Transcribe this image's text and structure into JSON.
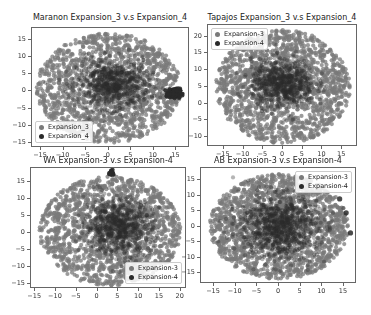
{
  "colors": {
    "expansion3": "#7a7a7a",
    "expansion4": "#2a2a2a",
    "axes_border": "#666666"
  },
  "chart_data": [
    {
      "type": "scatter",
      "title": "Maranon Expansion_3 v.s Expansion_4",
      "xlabel": "",
      "ylabel": "",
      "xticks": [
        -15,
        -10,
        -5,
        0,
        5,
        10,
        15
      ],
      "yticks": [
        -15,
        -10,
        -5,
        0,
        5,
        10,
        15
      ],
      "xlim": [
        -17,
        18
      ],
      "ylim": [
        -16.5,
        18.5
      ],
      "legend": {
        "position": "lower left",
        "entries": [
          "Expansion_3",
          "Expansion_4"
        ]
      },
      "series": [
        {
          "name": "Expansion_3",
          "distribution": "broad disk",
          "center": [
            0,
            1
          ],
          "radius": [
            16,
            16
          ],
          "count": 1400
        },
        {
          "name": "Expansion_4",
          "distribution": "dense core + tight cluster",
          "center": [
            1,
            2
          ],
          "radius": [
            8,
            7
          ],
          "count": 700,
          "extra_cluster": {
            "center": [
              14.5,
              -0.5
            ],
            "radius": [
              1.3,
              1.3
            ],
            "count": 160
          }
        }
      ]
    },
    {
      "type": "scatter",
      "title": "Tapajos Expansion_3 v.s Expansion_4",
      "xlabel": "",
      "ylabel": "",
      "xticks": [
        -15,
        -10,
        -5,
        0,
        5,
        10,
        15
      ],
      "yticks": [
        -10,
        -5,
        0,
        5,
        10,
        15,
        20
      ],
      "xlim": [
        -19,
        19
      ],
      "ylim": [
        -13,
        23.5
      ],
      "legend": {
        "position": "upper left",
        "entries": [
          "Expansion-3",
          "Expansion-4"
        ]
      },
      "series": [
        {
          "name": "Expansion-3",
          "distribution": "broad disk",
          "center": [
            0,
            5
          ],
          "radius": [
            17,
            17
          ],
          "count": 1500
        },
        {
          "name": "Expansion-4",
          "distribution": "dense core",
          "center": [
            0,
            6
          ],
          "radius": [
            8,
            7
          ],
          "count": 700
        }
      ]
    },
    {
      "type": "scatter",
      "title": "WA Expansion-3 v.s Expansion-4",
      "xlabel": "",
      "ylabel": "",
      "xticks": [
        -15,
        -10,
        -5,
        0,
        5,
        10,
        15,
        20
      ],
      "yticks": [
        -15,
        -10,
        -5,
        0,
        5,
        10,
        15
      ],
      "xlim": [
        -16,
        21.5
      ],
      "ylim": [
        -16.5,
        19
      ],
      "legend": {
        "position": "lower right",
        "entries": [
          "Expansion-3",
          "Expansion-4"
        ]
      },
      "series": [
        {
          "name": "Expansion-3",
          "distribution": "broad disk",
          "center": [
            3,
            0.5
          ],
          "radius": [
            17,
            16
          ],
          "count": 1500
        },
        {
          "name": "Expansion-4",
          "distribution": "dense core + small cluster",
          "center": [
            5,
            2
          ],
          "radius": [
            8,
            8
          ],
          "count": 700,
          "extra_cluster": {
            "center": [
              3.5,
              17.5
            ],
            "radius": [
              0.7,
              0.7
            ],
            "count": 20
          }
        }
      ]
    },
    {
      "type": "scatter",
      "title": "AB Expansion-3 v.s Expansion-4",
      "xlabel": "",
      "ylabel": "",
      "xticks": [
        -15,
        -10,
        -5,
        0,
        5,
        10,
        15
      ],
      "yticks": [
        -15,
        -10,
        -5,
        0,
        5,
        10,
        15
      ],
      "xlim": [
        -18,
        18
      ],
      "ylim": [
        -18.5,
        19
      ],
      "legend": {
        "position": "upper right",
        "entries": [
          "Expansion-3",
          "Expansion-4"
        ]
      },
      "series": [
        {
          "name": "Expansion-3",
          "distribution": "broad disk",
          "center": [
            0,
            0
          ],
          "radius": [
            16,
            17
          ],
          "count": 1600
        },
        {
          "name": "Expansion-4",
          "distribution": "dense core + outliers",
          "center": [
            0,
            0
          ],
          "radius": [
            9,
            10
          ],
          "count": 900,
          "outliers": [
            [
              15.5,
              4.5
            ],
            [
              16.5,
              -2
            ],
            [
              14,
              9
            ]
          ]
        }
      ]
    }
  ]
}
